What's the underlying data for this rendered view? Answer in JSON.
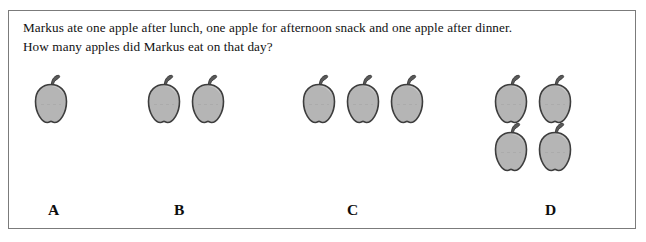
{
  "question": {
    "line1": "Markus ate one apple after lunch, one apple for afternoon snack and one apple after dinner.",
    "line2": "How many apples did Markus eat on that day?"
  },
  "options": [
    {
      "label": "A",
      "apple_count": 1,
      "layout": "row"
    },
    {
      "label": "B",
      "apple_count": 2,
      "layout": "row"
    },
    {
      "label": "C",
      "apple_count": 3,
      "layout": "row"
    },
    {
      "label": "D",
      "apple_count": 4,
      "layout": "grid-2x2"
    }
  ],
  "icons": {
    "apple": "apple-icon"
  },
  "colors": {
    "apple_body": "#b5b5b5",
    "apple_outline": "#3d3d3d",
    "apple_stem": "#5a5a5a",
    "apple_highlight": "#d2d2d2",
    "frame_border": "#7b7b7b",
    "text": "#111111",
    "background": "#ffffff"
  }
}
